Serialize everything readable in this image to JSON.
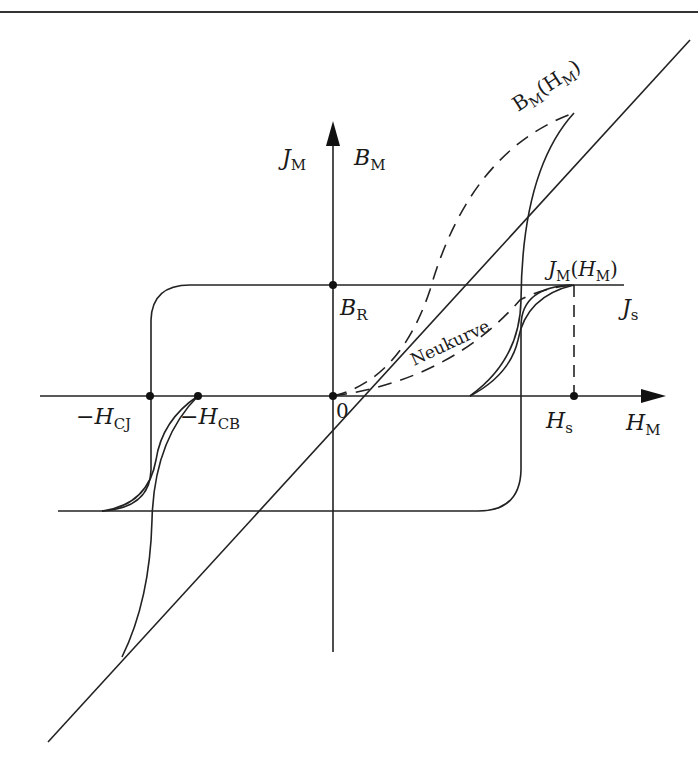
{
  "diagram": {
    "colors": {
      "line": "#222222",
      "background": "#ffffff"
    },
    "axes": {
      "horizontal": {
        "label_main": "H",
        "label_sub": "M"
      },
      "vertical": {
        "label_left_main": "J",
        "label_left_sub": "M",
        "label_right_main": "B",
        "label_right_sub": "M"
      },
      "origin_label": "0"
    },
    "points": {
      "remanence": {
        "main": "B",
        "sub": "R"
      },
      "coercivity_j": {
        "prefix": "−",
        "main": "H",
        "sub": "CJ"
      },
      "coercivity_b": {
        "prefix": "−",
        "main": "H",
        "sub": "CB"
      },
      "saturation_field": {
        "main": "H",
        "sub": "s"
      }
    },
    "curves": {
      "b_curve": {
        "main": "B",
        "sub": "M",
        "open": "(",
        "arg_main": "H",
        "arg_sub": "M",
        "close": ")"
      },
      "j_curve": {
        "main": "J",
        "sub": "M",
        "open": "(",
        "arg_main": "H",
        "arg_sub": "M",
        "close": ")"
      },
      "saturation": {
        "main": "J",
        "sub": "s"
      },
      "virgin_curve": "Neukurve"
    }
  }
}
